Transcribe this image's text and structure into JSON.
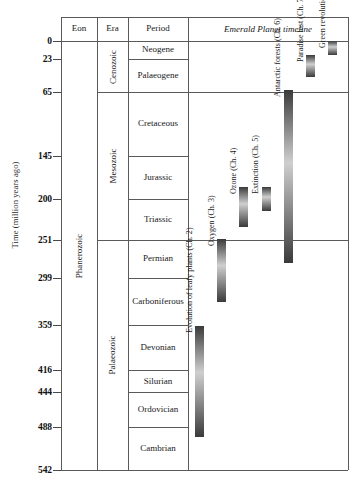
{
  "axis": {
    "title": "Time (million years ago)",
    "ticks": [
      {
        "label": "0",
        "value": 0
      },
      {
        "label": "23",
        "value": 23
      },
      {
        "label": "65",
        "value": 65
      },
      {
        "label": "145",
        "value": 145
      },
      {
        "label": "200",
        "value": 200
      },
      {
        "label": "251",
        "value": 251
      },
      {
        "label": "299",
        "value": 299
      },
      {
        "label": "359",
        "value": 359
      },
      {
        "label": "416",
        "value": 416
      },
      {
        "label": "444",
        "value": 444
      },
      {
        "label": "488",
        "value": 488
      },
      {
        "label": "542",
        "value": 542
      }
    ]
  },
  "table": {
    "headers": [
      "Eon",
      "Era",
      "Period"
    ],
    "eons": [
      {
        "label": "Phanerozoic",
        "start": 0,
        "end": 542
      }
    ],
    "eras": [
      {
        "label": "Cenozoic",
        "start": 0,
        "end": 65
      },
      {
        "label": "Mesozoic",
        "start": 65,
        "end": 251
      },
      {
        "label": "Palaeozoic",
        "start": 251,
        "end": 542
      }
    ],
    "periods": [
      {
        "label": "Neogene",
        "start": 0,
        "end": 23
      },
      {
        "label": "Palaeogene",
        "start": 23,
        "end": 65
      },
      {
        "label": "Cretaceous",
        "start": 65,
        "end": 145
      },
      {
        "label": "Jurassic",
        "start": 145,
        "end": 200
      },
      {
        "label": "Triassic",
        "start": 200,
        "end": 251
      },
      {
        "label": "Permian",
        "start": 251,
        "end": 299
      },
      {
        "label": "Carboniferous",
        "start": 299,
        "end": 359
      },
      {
        "label": "Devonian",
        "start": 359,
        "end": 416
      },
      {
        "label": "Silurian",
        "start": 416,
        "end": 444
      },
      {
        "label": "Ordovician",
        "start": 444,
        "end": 488
      },
      {
        "label": "Cambrian",
        "start": 488,
        "end": 542
      }
    ]
  },
  "timeline": {
    "title": "Emerald Planet timeline",
    "events": [
      {
        "label": "Evolution of leafy plants (Ch. 2)",
        "start": 360,
        "end": 500,
        "col": 0
      },
      {
        "label": "Oxygen (Ch. 3)",
        "start": 250,
        "end": 330,
        "col": 1
      },
      {
        "label": "Ozone (Ch. 4)",
        "start": 185,
        "end": 235,
        "col": 2
      },
      {
        "label": "Extinction (Ch. 5)",
        "start": 185,
        "end": 215,
        "col": 3
      },
      {
        "label": "Antarctic forests (Ch. 6)",
        "start": 62,
        "end": 280,
        "col": 4
      },
      {
        "label": "Paradise lost (Ch. 7)",
        "start": 18,
        "end": 45,
        "col": 5
      },
      {
        "label": "Green revolution (Ch. 8)",
        "start": 0,
        "end": 18,
        "col": 6
      }
    ]
  },
  "chart_data": {
    "type": "table",
    "ylabel": "Time (million years ago)",
    "ylim": [
      0,
      542
    ],
    "y_inverted": true,
    "grid": false,
    "columns": [
      "Eon",
      "Era",
      "Period",
      "Emerald Planet timeline"
    ],
    "axis_ticks": [
      0,
      23,
      65,
      145,
      200,
      251,
      299,
      359,
      416,
      444,
      488,
      542
    ],
    "eon_intervals": [
      {
        "name": "Phanerozoic",
        "from_ma": 542,
        "to_ma": 0
      }
    ],
    "era_intervals": [
      {
        "name": "Cenozoic",
        "from_ma": 65,
        "to_ma": 0
      },
      {
        "name": "Mesozoic",
        "from_ma": 251,
        "to_ma": 65
      },
      {
        "name": "Palaeozoic",
        "from_ma": 542,
        "to_ma": 251
      }
    ],
    "period_intervals": [
      {
        "name": "Neogene",
        "from_ma": 23,
        "to_ma": 0
      },
      {
        "name": "Palaeogene",
        "from_ma": 65,
        "to_ma": 23
      },
      {
        "name": "Cretaceous",
        "from_ma": 145,
        "to_ma": 65
      },
      {
        "name": "Jurassic",
        "from_ma": 200,
        "to_ma": 145
      },
      {
        "name": "Triassic",
        "from_ma": 251,
        "to_ma": 200
      },
      {
        "name": "Permian",
        "from_ma": 299,
        "to_ma": 251
      },
      {
        "name": "Carboniferous",
        "from_ma": 359,
        "to_ma": 299
      },
      {
        "name": "Devonian",
        "from_ma": 416,
        "to_ma": 359
      },
      {
        "name": "Silurian",
        "from_ma": 444,
        "to_ma": 416
      },
      {
        "name": "Ordovician",
        "from_ma": 488,
        "to_ma": 444
      },
      {
        "name": "Cambrian",
        "from_ma": 542,
        "to_ma": 488
      }
    ],
    "event_bars": [
      {
        "name": "Evolution of leafy plants (Ch. 2)",
        "from_ma": 500,
        "to_ma": 360
      },
      {
        "name": "Oxygen (Ch. 3)",
        "from_ma": 330,
        "to_ma": 250
      },
      {
        "name": "Ozone (Ch. 4)",
        "from_ma": 235,
        "to_ma": 185
      },
      {
        "name": "Extinction (Ch. 5)",
        "from_ma": 215,
        "to_ma": 185
      },
      {
        "name": "Antarctic forests (Ch. 6)",
        "from_ma": 280,
        "to_ma": 62
      },
      {
        "name": "Paradise lost (Ch. 7)",
        "from_ma": 45,
        "to_ma": 18
      },
      {
        "name": "Green revolution (Ch. 8)",
        "from_ma": 18,
        "to_ma": 0
      }
    ],
    "bar_color_dark": "#3a3a3a",
    "bar_color_light": "#cfcfcf"
  }
}
